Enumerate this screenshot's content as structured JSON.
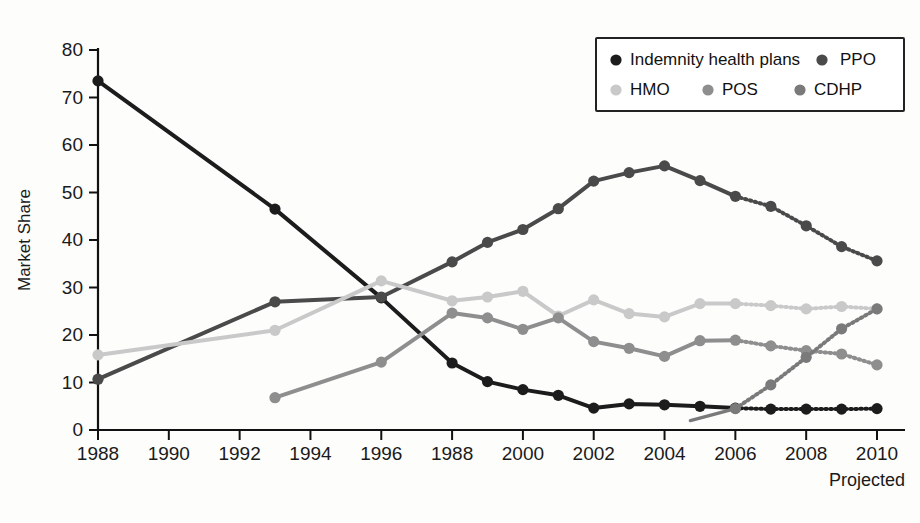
{
  "chart_data": {
    "type": "line",
    "title": "",
    "xlabel": "",
    "ylabel": "Market Share",
    "xlim": [
      1988,
      2010
    ],
    "ylim": [
      0,
      80
    ],
    "grid": false,
    "legend_position": "top-right",
    "x_tick_labels": [
      "1988",
      "1990",
      "1992",
      "1994",
      "1996",
      "1988",
      "2000",
      "2002",
      "2004",
      "2006",
      "2008",
      "2010"
    ],
    "x_tick_values": [
      1988,
      1990,
      1992,
      1994,
      1996,
      1998,
      2000,
      2002,
      2004,
      2006,
      2008,
      2010
    ],
    "y_tick_labels": [
      "0",
      "10",
      "20",
      "30",
      "40",
      "50",
      "60",
      "70",
      "80"
    ],
    "y_tick_values": [
      0,
      10,
      20,
      30,
      40,
      50,
      60,
      70,
      80
    ],
    "annotation": "Projected",
    "projection_starts": 2006,
    "series": [
      {
        "name": "Indemnity health plans",
        "color": "#1c1c1c",
        "x": [
          1988,
          1993,
          1996,
          1998,
          1999,
          2000,
          2001,
          2002,
          2003,
          2004,
          2005,
          2006,
          2007,
          2008,
          2009,
          2010
        ],
        "values": [
          73.5,
          46.5,
          27.8,
          14.1,
          10.2,
          8.5,
          7.3,
          4.6,
          5.5,
          5.3,
          5.0,
          4.6,
          4.4,
          4.4,
          4.4,
          4.5
        ]
      },
      {
        "name": "PPO",
        "color": "#4a4a4a",
        "x": [
          1988,
          1993,
          1996,
          1998,
          1999,
          2000,
          2001,
          2002,
          2003,
          2004,
          2005,
          2006,
          2007,
          2008,
          2009,
          2010
        ],
        "values": [
          10.7,
          27.0,
          28.0,
          35.4,
          39.5,
          42.2,
          46.6,
          52.4,
          54.2,
          55.6,
          52.5,
          49.2,
          47.1,
          43.0,
          38.6,
          35.6
        ]
      },
      {
        "name": "HMO",
        "color": "#c9c9c9",
        "x": [
          1988,
          1993,
          1996,
          1998,
          1999,
          2000,
          2001,
          2002,
          2003,
          2004,
          2005,
          2006,
          2007,
          2008,
          2009,
          2010
        ],
        "values": [
          15.8,
          21.0,
          31.4,
          27.2,
          28.0,
          29.2,
          24.0,
          27.4,
          24.5,
          23.8,
          26.6,
          26.6,
          26.2,
          25.5,
          26.0,
          25.5
        ]
      },
      {
        "name": "POS",
        "color": "#8e8e8e",
        "x": [
          1993,
          1996,
          1998,
          1999,
          2000,
          2001,
          2002,
          2003,
          2004,
          2005,
          2006,
          2007,
          2008,
          2009,
          2010
        ],
        "values": [
          6.8,
          14.3,
          24.6,
          23.6,
          21.2,
          23.6,
          18.6,
          17.2,
          15.5,
          18.8,
          18.9,
          17.7,
          16.7,
          16.0,
          13.7
        ]
      },
      {
        "name": "CDHP",
        "color": "#7a7a7a",
        "x": [
          2006,
          2007,
          2008,
          2009,
          2010
        ],
        "values": [
          4.5,
          9.5,
          15.3,
          21.3,
          25.5
        ]
      }
    ]
  },
  "legend": {
    "row1": [
      {
        "label": "Indemnity health plans",
        "color": "#1c1c1c"
      },
      {
        "label": "PPO",
        "color": "#4a4a4a"
      }
    ],
    "row2": [
      {
        "label": "HMO",
        "color": "#c9c9c9"
      },
      {
        "label": "POS",
        "color": "#8e8e8e"
      },
      {
        "label": "CDHP",
        "color": "#7a7a7a"
      }
    ]
  }
}
